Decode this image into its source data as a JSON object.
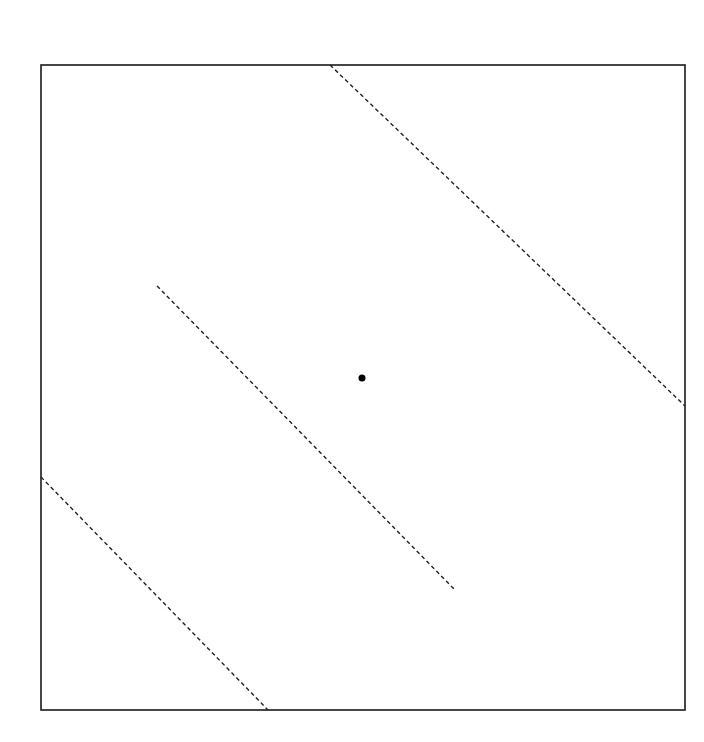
{
  "diagram": {
    "type": "geometric-figure",
    "frame": {
      "x1": 41,
      "y1": 65,
      "x2": 685,
      "y2": 710,
      "stroke": "#1a1a1a"
    },
    "lines": [
      {
        "name": "upper-dashed-line",
        "x1": 330,
        "y1": 65,
        "x2": 685,
        "y2": 406,
        "style": "dashed"
      },
      {
        "name": "middle-dashed-line",
        "x1": 157,
        "y1": 286,
        "x2": 455,
        "y2": 590,
        "style": "dashed"
      },
      {
        "name": "lower-dashed-line",
        "x1": 41,
        "y1": 477,
        "x2": 268,
        "y2": 710,
        "style": "dashed"
      }
    ],
    "point": {
      "name": "center-point",
      "cx": 362,
      "cy": 378,
      "r": 3.5,
      "fill": "#000000"
    },
    "colors": {
      "line": "#222222",
      "background": "#ffffff"
    }
  }
}
